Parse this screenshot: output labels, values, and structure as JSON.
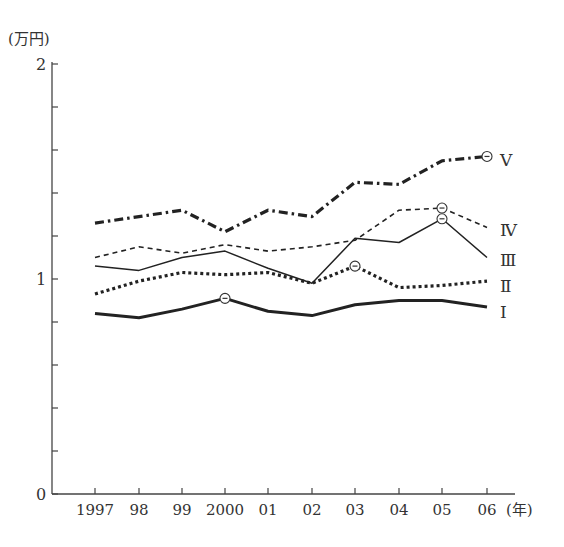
{
  "chart_data": {
    "type": "line",
    "title": "",
    "ylabel": "(万円)",
    "xlabel": "(年)",
    "ylim": [
      0,
      2
    ],
    "y_ticks": [
      0,
      0.2,
      0.4,
      0.6,
      0.8,
      1,
      1.2,
      1.4,
      1.6,
      1.8,
      2
    ],
    "y_tick_labels": [
      "0",
      "1",
      "2"
    ],
    "grid": false,
    "legend_position": "inline-right",
    "categories": [
      "1997",
      "98",
      "99",
      "2000",
      "01",
      "02",
      "03",
      "04",
      "05",
      "06"
    ],
    "series": [
      {
        "name": "V",
        "style": "dash-dot-bold",
        "values": [
          1.26,
          1.29,
          1.32,
          1.22,
          1.32,
          1.29,
          1.45,
          1.44,
          1.55,
          1.57
        ],
        "circled_index": 9
      },
      {
        "name": "IV",
        "style": "dashed-thin",
        "values": [
          1.1,
          1.15,
          1.12,
          1.16,
          1.13,
          1.15,
          1.18,
          1.32,
          1.33,
          1.24
        ],
        "circled_index": 8
      },
      {
        "name": "III",
        "style": "solid-thin",
        "values": [
          1.06,
          1.04,
          1.1,
          1.13,
          1.05,
          0.98,
          1.19,
          1.17,
          1.28,
          1.1
        ],
        "circled_index": 8
      },
      {
        "name": "II",
        "style": "dotted-bold",
        "values": [
          0.93,
          0.99,
          1.03,
          1.02,
          1.03,
          0.98,
          1.06,
          0.96,
          0.97,
          0.99
        ],
        "circled_index": 6
      },
      {
        "name": "I",
        "style": "solid-bold",
        "values": [
          0.84,
          0.82,
          0.86,
          0.91,
          0.85,
          0.83,
          0.88,
          0.9,
          0.9,
          0.87
        ],
        "circled_index": 3
      }
    ]
  },
  "labels": {
    "y_unit": "(万円)",
    "x_unit": "(年)",
    "series_labels": [
      "Ⅴ",
      "Ⅳ",
      "Ⅲ",
      "Ⅱ",
      "Ⅰ"
    ]
  }
}
